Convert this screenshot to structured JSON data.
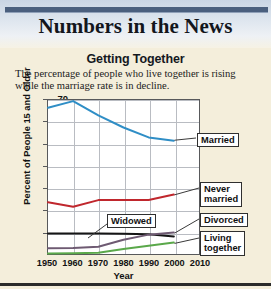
{
  "masthead": {
    "title": "Numbers in the News"
  },
  "chart_data": {
    "type": "line",
    "title": "Getting Together",
    "subtitle": "The percentage of people who live together is rising while the marriage rate is in decline.",
    "xlabel": "Year",
    "ylabel": "Percent of People 15 and Older",
    "x": [
      1950,
      1960,
      1970,
      1980,
      1990,
      2000
    ],
    "xticks": [
      "1950",
      "1960",
      "1970",
      "1980",
      "1990",
      "2000",
      "2010"
    ],
    "xlim": [
      1950,
      2010
    ],
    "ylim": [
      0,
      70
    ],
    "yticks": [
      "10",
      "20",
      "30",
      "40",
      "50",
      "60",
      "70"
    ],
    "grid": true,
    "legend": "inline-callouts",
    "series": [
      {
        "name": "Married",
        "color": "#2f8ec6",
        "values": [
          66.5,
          69.5,
          63.0,
          57.5,
          53.0,
          51.5
        ],
        "callout": "Married"
      },
      {
        "name": "Never married",
        "color": "#c0272d",
        "values": [
          23.5,
          21.5,
          24.5,
          24.5,
          24.5,
          27.0
        ],
        "callout": "Never\nmarried"
      },
      {
        "name": "Widowed",
        "color": "#151515",
        "values": [
          9.3,
          9.3,
          9.3,
          9.2,
          9.0,
          8.0
        ],
        "callout": "Widowed"
      },
      {
        "name": "Divorced",
        "color": "#6e5a72",
        "values": [
          2.6,
          2.7,
          3.3,
          6.5,
          8.8,
          9.8
        ],
        "callout": "Divorced"
      },
      {
        "name": "Living together",
        "color": "#5aa84a",
        "values": [
          0.2,
          0.3,
          0.6,
          2.3,
          3.8,
          5.2
        ],
        "callout": "Living\ntogether"
      }
    ]
  }
}
